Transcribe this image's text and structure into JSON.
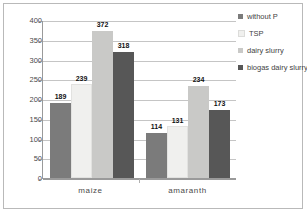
{
  "chart_data": {
    "type": "bar",
    "title": "",
    "xlabel": "",
    "ylabel": "µg TPF/g/24 h",
    "categories": [
      "maize",
      "amaranth"
    ],
    "series": [
      {
        "name": "without P",
        "values": [
          189,
          114
        ],
        "color": "#7b7b7b"
      },
      {
        "name": "TSP",
        "values": [
          239,
          131
        ],
        "color": "#f0f0ee"
      },
      {
        "name": "dairy slurry",
        "values": [
          372,
          234
        ],
        "color": "#c9c9c7"
      },
      {
        "name": "biogas dairy slurry",
        "values": [
          318,
          173
        ],
        "color": "#575757"
      }
    ],
    "ylim": [
      0,
      400
    ],
    "yticks": [
      0,
      50,
      100,
      150,
      200,
      250,
      300,
      350,
      400
    ],
    "ytick_labels": [
      "0",
      "50",
      "100",
      "150",
      "200",
      "250",
      "300",
      "350",
      "400"
    ],
    "grid": true,
    "legend_position": "right",
    "data_labels": [
      [
        "189",
        "239",
        "372",
        "318"
      ],
      [
        "114",
        "131",
        "234",
        "173"
      ]
    ]
  },
  "legend": {
    "items": [
      {
        "label": "without P"
      },
      {
        "label": "TSP"
      },
      {
        "label": "dairy slurry"
      },
      {
        "label": "biogas dairy slurry"
      }
    ]
  },
  "axes": {
    "y_title": "µg TPF/g/24 h"
  }
}
